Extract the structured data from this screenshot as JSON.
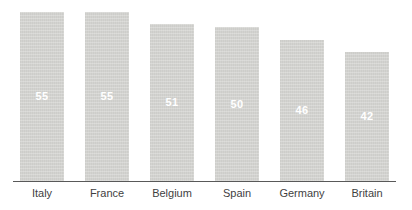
{
  "chart_data": {
    "type": "bar",
    "title": "",
    "xlabel": "",
    "ylabel": "",
    "categories": [
      "Italy",
      "France",
      "Belgium",
      "Spain",
      "Germany",
      "Britain"
    ],
    "values": [
      55,
      55,
      51,
      50,
      46,
      42
    ],
    "ylim": [
      0,
      57
    ],
    "grid": false,
    "legend_position": "none",
    "value_label_position": "inside-center",
    "colors": {
      "bar_fill": "#d3d3d0",
      "value_label": "#ffffff",
      "category_label": "#3f3f3f",
      "axis_line": "#595959",
      "background": "#ffffff"
    }
  }
}
